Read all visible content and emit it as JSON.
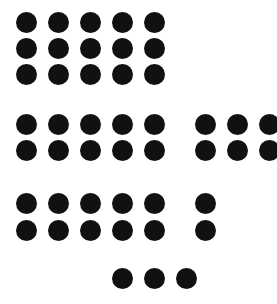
{
  "canvas": {
    "width": 277,
    "height": 304,
    "background_color": "#ffffff",
    "dot_color": "#111111",
    "dot_diameter": 21,
    "column_pitch": 32,
    "row_pitch": 26,
    "description": "black-dot-grid-pattern"
  },
  "chart_data": {
    "type": "scatter",
    "title": "",
    "subtitle": "",
    "xlabel": "",
    "ylabel": "",
    "grid": false,
    "legend": null,
    "xlim": [
      0,
      277
    ],
    "ylim": [
      0,
      304
    ],
    "marker": "filled-circle",
    "marker_size": 21,
    "marker_color": "#111111",
    "total_dots": 35,
    "bands": [
      {
        "name": "band-1-top-block",
        "rows": 3,
        "columns": 5,
        "dot_count": 15,
        "row_y": [
          12,
          38,
          64
        ],
        "col_x": [
          16,
          48,
          80,
          112,
          144
        ]
      },
      {
        "name": "band-2-left-group",
        "rows": 2,
        "columns": 5,
        "dot_count": 10,
        "row_y": [
          114,
          140
        ],
        "col_x": [
          16,
          48,
          80,
          112,
          144
        ]
      },
      {
        "name": "band-2-right-group",
        "rows": 2,
        "columns": 3,
        "dot_count": 6,
        "row_y": [
          114,
          140
        ],
        "col_x": [
          195,
          227,
          259
        ],
        "clipped_right_edge": true
      },
      {
        "name": "band-3-left-group",
        "rows": 2,
        "columns": 5,
        "dot_count": 10,
        "row_y": [
          193,
          220
        ],
        "col_x": [
          16,
          48,
          80,
          112,
          144
        ]
      },
      {
        "name": "band-3-right-single",
        "rows": 2,
        "columns": 1,
        "dot_count": 2,
        "row_y": [
          193,
          220
        ],
        "col_x": [
          195
        ]
      },
      {
        "name": "band-4-bottom-row",
        "rows": 1,
        "columns": 3,
        "dot_count": 3,
        "row_y": [
          268
        ],
        "col_x": [
          112,
          144,
          176
        ]
      }
    ],
    "x": [
      16,
      48,
      80,
      112,
      144,
      16,
      48,
      80,
      112,
      144,
      16,
      48,
      80,
      112,
      144,
      16,
      48,
      80,
      112,
      144,
      195,
      227,
      259,
      16,
      48,
      80,
      112,
      144,
      195,
      227,
      259,
      16,
      48,
      80,
      112,
      144,
      195,
      16,
      48,
      80,
      112,
      144,
      195,
      112,
      144,
      176
    ],
    "y": [
      12,
      12,
      12,
      12,
      12,
      38,
      38,
      38,
      38,
      38,
      64,
      64,
      64,
      64,
      64,
      114,
      114,
      114,
      114,
      114,
      114,
      114,
      114,
      140,
      140,
      140,
      140,
      140,
      140,
      140,
      140,
      193,
      193,
      193,
      193,
      193,
      193,
      220,
      220,
      220,
      220,
      220,
      220,
      268,
      268,
      268
    ]
  }
}
